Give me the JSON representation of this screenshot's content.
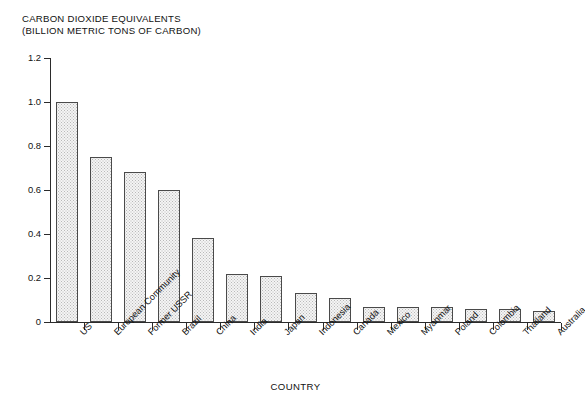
{
  "chart_data": {
    "type": "bar",
    "title": "CARBON DIOXIDE EQUIVALENTS (BILLION METRIC TONS OF CARBON)",
    "title_lines": [
      "CARBON DIOXIDE EQUIVALENTS",
      "(BILLION METRIC TONS OF CARBON)"
    ],
    "xlabel": "COUNTRY",
    "ylabel": "",
    "ylim": [
      0,
      1.2
    ],
    "yticks": [
      0,
      0.2,
      0.4,
      0.6,
      0.8,
      1.0,
      1.2
    ],
    "ytick_labels": [
      "0",
      "0.2",
      "0.4",
      "0.6",
      "0.8",
      "1.0",
      "1.2"
    ],
    "grid": false,
    "legend": null,
    "categories": [
      "US",
      "European Community",
      "Former USSR",
      "Brazil",
      "China",
      "India",
      "Japan",
      "Indonesia",
      "Canada",
      "Mexico",
      "Myanmar",
      "Poland",
      "Colombia",
      "Thailand",
      "Australia"
    ],
    "values": [
      1.0,
      0.75,
      0.68,
      0.6,
      0.38,
      0.22,
      0.21,
      0.13,
      0.11,
      0.07,
      0.07,
      0.07,
      0.06,
      0.06,
      0.05
    ],
    "bar_fill_color": "#f4f4f4",
    "bar_edge_color": "#4a4a4a",
    "axis_color": "#2b2b2b",
    "background_color": "#ffffff"
  }
}
